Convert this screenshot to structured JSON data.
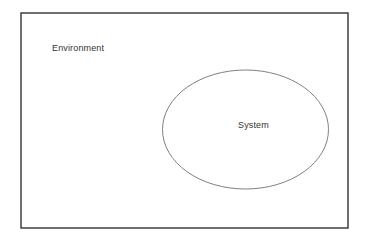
{
  "diagram": {
    "type": "nested-boundary-diagram",
    "background_color": "#ffffff",
    "outer_boundary": {
      "shape": "rectangle",
      "label": "Environment",
      "stroke_color": "#333333",
      "fill_color": "#ffffff",
      "stroke_width": 1.4,
      "x": 21,
      "y": 13,
      "width": 327,
      "height": 215
    },
    "inner_boundary": {
      "shape": "ellipse",
      "label": "System",
      "stroke_color": "#808080",
      "fill_color": "#ffffff",
      "stroke_width": 1,
      "cx": 245.5,
      "cy": 129.5,
      "rx": 83,
      "ry": 59.5
    },
    "labels": {
      "environment": "Environment",
      "system": "System"
    }
  }
}
